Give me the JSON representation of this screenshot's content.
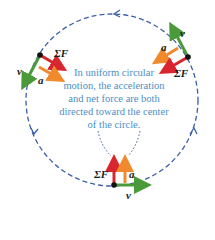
{
  "caption": "In uniform circular motion, the acceleration and net force are both directed toward the center of the circle.",
  "labels": {
    "velocity": "v",
    "acceleration": "a",
    "net_force": "ΣF"
  },
  "colors": {
    "path": "#3b5fa8",
    "velocity": "#4a9a3a",
    "acceleration": "#f08a2c",
    "net_force": "#d9262e",
    "caption": "#4a8fc9",
    "pointer": "#3b5fa8"
  },
  "motion_direction": "counterclockwise",
  "positions": [
    "upper-left",
    "upper-right",
    "bottom"
  ]
}
